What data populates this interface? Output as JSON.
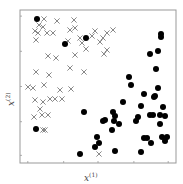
{
  "chart_data": {
    "type": "scatter",
    "title": "",
    "xlabel": "x",
    "xlabel_sup": "(1)",
    "ylabel": "x",
    "ylabel_sup": "(2)",
    "xlim": [
      0,
      1
    ],
    "ylim": [
      0,
      1
    ],
    "grid": false,
    "legend": null,
    "tick_labels_shown": false,
    "x_ticks": [
      0.05,
      0.28,
      0.5,
      0.73,
      0.95
    ],
    "y_ticks": [
      0.05,
      0.27,
      0.5,
      0.73,
      0.96
    ],
    "frame": {
      "left": 20,
      "top": 10,
      "right": 176,
      "bottom": 163
    },
    "series": [
      {
        "name": "class-cross",
        "marker": "x",
        "color": "#888888",
        "points_px": [
          [
            44,
            19
          ],
          [
            39,
            25
          ],
          [
            43,
            27
          ],
          [
            35,
            31
          ],
          [
            38,
            33
          ],
          [
            36,
            40
          ],
          [
            47,
            33
          ],
          [
            53,
            33
          ],
          [
            57,
            21
          ],
          [
            70,
            30
          ],
          [
            68,
            41
          ],
          [
            74,
            20
          ],
          [
            75,
            28
          ],
          [
            80,
            38
          ],
          [
            82,
            43
          ],
          [
            86,
            49
          ],
          [
            95,
            31
          ],
          [
            92,
            36
          ],
          [
            100,
            42
          ],
          [
            103,
            38
          ],
          [
            107,
            33
          ],
          [
            113,
            30
          ],
          [
            104,
            54
          ],
          [
            107,
            50
          ],
          [
            48,
            56
          ],
          [
            56,
            58
          ],
          [
            70,
            68
          ],
          [
            75,
            55
          ],
          [
            36,
            72
          ],
          [
            49,
            75
          ],
          [
            84,
            72
          ],
          [
            28,
            87
          ],
          [
            33,
            88
          ],
          [
            44,
            85
          ],
          [
            60,
            90
          ],
          [
            71,
            89
          ],
          [
            35,
            100
          ],
          [
            43,
            102
          ],
          [
            50,
            99
          ],
          [
            55,
            99
          ],
          [
            62,
            99
          ],
          [
            40,
            109
          ],
          [
            34,
            117
          ],
          [
            42,
            115
          ],
          [
            48,
            115
          ],
          [
            43,
            130
          ],
          [
            45,
            130
          ],
          [
            99,
            154
          ]
        ]
      },
      {
        "name": "class-circle",
        "marker": "o",
        "color": "#000000",
        "points_px": [
          [
            37,
            19
          ],
          [
            65,
            44
          ],
          [
            86,
            38
          ],
          [
            36,
            129
          ],
          [
            161,
            34
          ],
          [
            161,
            37
          ],
          [
            158,
            51
          ],
          [
            150,
            54
          ],
          [
            156,
            69
          ],
          [
            129,
            77
          ],
          [
            131,
            85
          ],
          [
            158,
            88
          ],
          [
            144,
            94
          ],
          [
            155,
            96
          ],
          [
            154,
            97
          ],
          [
            123,
            102
          ],
          [
            84,
            112
          ],
          [
            141,
            106
          ],
          [
            163,
            107
          ],
          [
            113,
            112
          ],
          [
            150,
            115
          ],
          [
            103,
            121
          ],
          [
            105,
            120
          ],
          [
            115,
            116
          ],
          [
            114,
            121
          ],
          [
            153,
            115
          ],
          [
            160,
            115
          ],
          [
            165,
            116
          ],
          [
            119,
            124
          ],
          [
            138,
            117
          ],
          [
            136,
            121
          ],
          [
            160,
            124
          ],
          [
            112,
            130
          ],
          [
            97,
            137
          ],
          [
            99,
            143
          ],
          [
            144,
            138
          ],
          [
            147,
            138
          ],
          [
            162,
            137
          ],
          [
            167,
            137
          ],
          [
            165,
            141
          ],
          [
            151,
            143
          ],
          [
            95,
            147
          ],
          [
            115,
            151
          ],
          [
            80,
            154
          ],
          [
            141,
            152
          ]
        ]
      }
    ]
  },
  "colors": {
    "frame": "#999999",
    "cross": "#888888",
    "circle": "#000000",
    "background": "#ffffff"
  }
}
